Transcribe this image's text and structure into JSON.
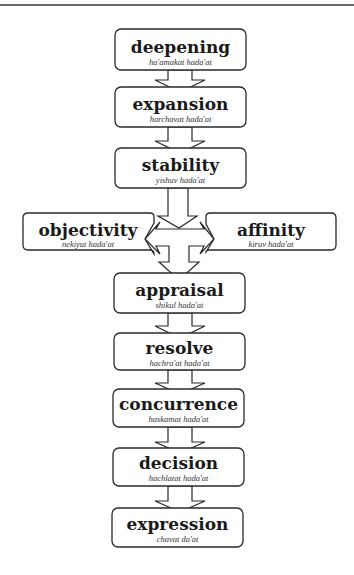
{
  "diagram": {
    "type": "flow",
    "direction": "top-to-bottom",
    "nodes": [
      {
        "id": "deepening",
        "title": "deepening",
        "subtitle": "ha'amakat hada'at"
      },
      {
        "id": "expansion",
        "title": "expansion",
        "subtitle": "harchavat hada'at"
      },
      {
        "id": "stability",
        "title": "stability",
        "subtitle": "yishuv hada'at"
      },
      {
        "id": "objectivity",
        "title": "objectivity",
        "subtitle": "nekiyut hada'at"
      },
      {
        "id": "affinity",
        "title": "affinity",
        "subtitle": "kiruv hada'at"
      },
      {
        "id": "appraisal",
        "title": "appraisal",
        "subtitle": "shikul hada'at"
      },
      {
        "id": "resolve",
        "title": "resolve",
        "subtitle": "hachra'at hada'at"
      },
      {
        "id": "concurrence",
        "title": "concurrence",
        "subtitle": "haskamat hada'at"
      },
      {
        "id": "decision",
        "title": "decision",
        "subtitle": "hachlatat hada'at"
      },
      {
        "id": "expression",
        "title": "expression",
        "subtitle": "chavat da'at"
      }
    ],
    "edges": [
      [
        "deepening",
        "expansion"
      ],
      [
        "expansion",
        "stability"
      ],
      [
        "stability",
        "objectivity"
      ],
      [
        "stability",
        "affinity"
      ],
      [
        "stability",
        "appraisal"
      ],
      [
        "appraisal",
        "resolve"
      ],
      [
        "resolve",
        "concurrence"
      ],
      [
        "concurrence",
        "decision"
      ],
      [
        "decision",
        "expression"
      ]
    ]
  }
}
